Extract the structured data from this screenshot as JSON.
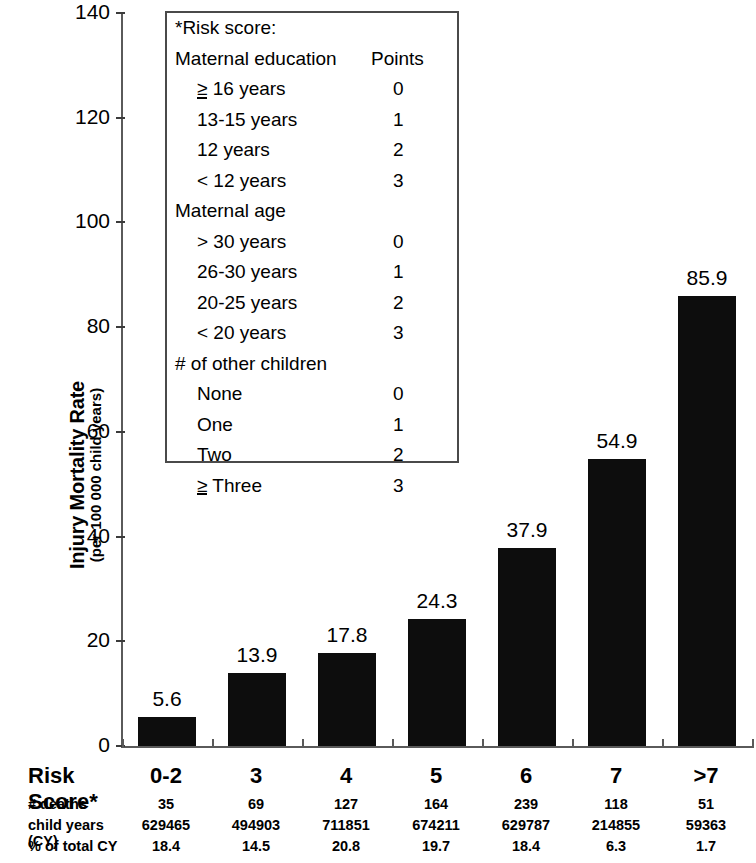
{
  "chart_data": {
    "type": "bar",
    "title": "",
    "xlabel": "Risk Score*",
    "ylabel": "Injury Mortality Rate (per 100 000 child years)",
    "categories": [
      "0-2",
      "3",
      "4",
      "5",
      "6",
      "7",
      ">7"
    ],
    "values": [
      5.6,
      13.9,
      17.8,
      24.3,
      37.9,
      54.9,
      85.9
    ],
    "value_labels": [
      "5.6",
      "13.9",
      "17.8",
      "24.3",
      "37.9",
      "54.9",
      "85.9"
    ],
    "ylim": [
      0,
      140
    ],
    "yticks": [
      0,
      20,
      40,
      60,
      80,
      100,
      120,
      140
    ],
    "ytick_labels": [
      "0",
      "20",
      "40",
      "60",
      "80",
      "100",
      "120",
      "140"
    ],
    "grid": false,
    "legend": "none",
    "bar_color": "#0d0d0d"
  },
  "y_axis": {
    "title_main": "Injury Mortality Rate",
    "title_sub": "(per 100 000 child years)",
    "ticks": [
      {
        "value": 140,
        "label": "140"
      },
      {
        "value": 120,
        "label": "120"
      },
      {
        "value": 100,
        "label": "100"
      },
      {
        "value": 80,
        "label": "80"
      },
      {
        "value": 60,
        "label": "60"
      },
      {
        "value": 40,
        "label": "40"
      },
      {
        "value": 20,
        "label": "20"
      },
      {
        "value": 0,
        "label": "0"
      }
    ]
  },
  "risk_box": {
    "title": "*Risk score:",
    "sections": [
      {
        "heading": "Maternal education",
        "heading_points": "Points",
        "rows": [
          {
            "label": "≥ 16 years",
            "underline_prefix": "≥",
            "rest": " 16 years",
            "points": "0"
          },
          {
            "label": "13-15 years",
            "points": "1"
          },
          {
            "label": "12 years",
            "points": "2"
          },
          {
            "label": "< 12 years",
            "points": "3"
          }
        ]
      },
      {
        "heading": "Maternal age",
        "heading_points": "",
        "rows": [
          {
            "label": "> 30 years",
            "points": "0"
          },
          {
            "label": "26-30 years",
            "points": "1"
          },
          {
            "label": "20-25 years",
            "points": "2"
          },
          {
            "label": "< 20 years",
            "points": "3"
          }
        ]
      },
      {
        "heading": "# of other children",
        "heading_points": "",
        "rows": [
          {
            "label": "None",
            "points": "0"
          },
          {
            "label": "One",
            "points": "1"
          },
          {
            "label": "Two",
            "points": "2"
          },
          {
            "label": "≥ Three",
            "underline_prefix": "≥",
            "rest": " Three",
            "points": "3"
          }
        ]
      }
    ]
  },
  "bottom_table": {
    "header_label": "Risk Score*",
    "header_cells": [
      "0-2",
      "3",
      "4",
      "5",
      "6",
      "7",
      ">7"
    ],
    "rows": [
      {
        "label": "# deaths",
        "cells": [
          "35",
          "69",
          "127",
          "164",
          "239",
          "118",
          "51"
        ]
      },
      {
        "label": "child years (CY)",
        "cells": [
          "629465",
          "494903",
          "711851",
          "674211",
          "629787",
          "214855",
          "59363"
        ]
      },
      {
        "label": "% of total CY",
        "cells": [
          "18.4",
          "14.5",
          "20.8",
          "19.7",
          "18.4",
          "6.3",
          "1.7"
        ]
      }
    ]
  }
}
